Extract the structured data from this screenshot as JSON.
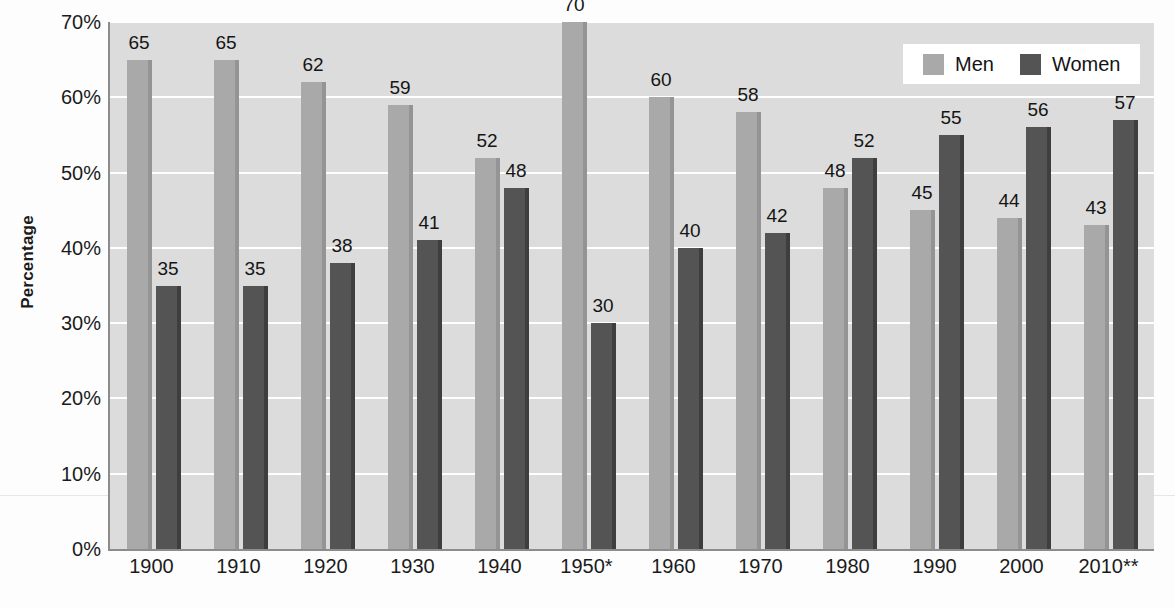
{
  "chart_data": {
    "type": "bar",
    "title": "",
    "xlabel": "",
    "ylabel": "Percentage",
    "ylim": [
      0,
      70
    ],
    "grid": true,
    "legend_position": "top-right",
    "categories": [
      "1900",
      "1910",
      "1920",
      "1930",
      "1940",
      "1950*",
      "1960",
      "1970",
      "1980",
      "1990",
      "2000",
      "2010**"
    ],
    "series": [
      {
        "name": "Men",
        "color": "#a9a9a9",
        "values": [
          65,
          65,
          62,
          59,
          52,
          70,
          60,
          58,
          48,
          45,
          44,
          43
        ]
      },
      {
        "name": "Women",
        "color": "#545454",
        "values": [
          35,
          35,
          38,
          41,
          48,
          30,
          40,
          42,
          52,
          55,
          56,
          57
        ]
      }
    ],
    "y_ticks": [
      {
        "value": 0,
        "label": "0%"
      },
      {
        "value": 10,
        "label": "10%"
      },
      {
        "value": 20,
        "label": "20%"
      },
      {
        "value": 30,
        "label": "30%"
      },
      {
        "value": 40,
        "label": "40%"
      },
      {
        "value": 50,
        "label": "50%"
      },
      {
        "value": 60,
        "label": "60%"
      },
      {
        "value": 70,
        "label": "70%"
      }
    ]
  },
  "axis": {
    "y_title": "Percentage"
  },
  "legend": {
    "items": [
      {
        "label": "Men",
        "color": "#a9a9a9"
      },
      {
        "label": "Women",
        "color": "#545454"
      }
    ]
  },
  "colors": {
    "plot_background": "#dcdcdc",
    "gridline": "#ffffff",
    "axis_line": "#8c8c8c",
    "men": "#a9a9a9",
    "women": "#545454",
    "text": "#1b1b1b"
  }
}
